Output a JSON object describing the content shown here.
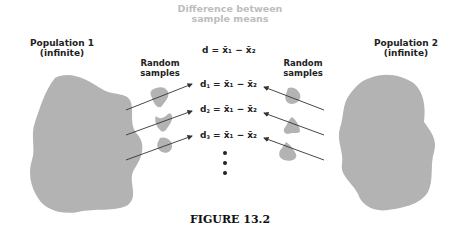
{
  "header": {
    "line1": "Difference between",
    "line2": "sample means",
    "color": "#bdbdbd"
  },
  "population1": {
    "line1": "Population 1",
    "line2": "(infinite)"
  },
  "population2": {
    "line1": "Population 2",
    "line2": "(infinite)"
  },
  "random_samples_left": {
    "line1": "Random",
    "line2": "samples"
  },
  "random_samples_right": {
    "line1": "Random",
    "line2": "samples"
  },
  "equations": [
    {
      "d": "d",
      "sub": "",
      "rest": "= x̄₁ − x̄₂"
    },
    {
      "d": "d",
      "sub": "1",
      "rest": "= x̄₁ − x̄₂"
    },
    {
      "d": "d",
      "sub": "2",
      "rest": "= x̄₁ − x̄₂"
    },
    {
      "d": "d",
      "sub": "3",
      "rest": "= x̄₁ − x̄₂"
    }
  ],
  "caption": "FIGURE 13.2",
  "colors": {
    "blob": "#b3b3b3",
    "text": "#222222",
    "arrow": "#333333"
  }
}
